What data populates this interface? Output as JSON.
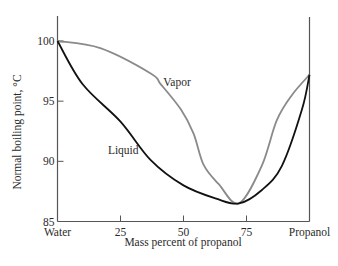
{
  "chart_data": {
    "type": "line",
    "title": "",
    "xlabel": "Mass percent of propanol",
    "ylabel": "Normal boiling point, °C",
    "xlim": [
      0,
      100
    ],
    "ylim": [
      85,
      100
    ],
    "x_ticks": [
      0,
      25,
      50,
      75,
      100
    ],
    "x_tick_labels": [
      "Water",
      "25",
      "50",
      "75",
      "Propanol"
    ],
    "y_ticks": [
      85,
      90,
      95,
      100
    ],
    "y_tick_labels": [
      "85",
      "90",
      "95",
      "100"
    ],
    "grid": false,
    "legend": "inline labels",
    "series": [
      {
        "name": "Vapor",
        "color": "#8a8a8a",
        "x": [
          0,
          17,
          37,
          41,
          49,
          54,
          58,
          64,
          72,
          81,
          87,
          93,
          100
        ],
        "y": [
          100,
          99.4,
          97.3,
          96.4,
          94.3,
          92.3,
          89.7,
          88.1,
          86.5,
          89.6,
          93.4,
          95.5,
          97.2
        ]
      },
      {
        "name": "Liquid",
        "color": "#111111",
        "x": [
          0,
          10,
          25,
          37,
          50,
          63,
          72,
          81,
          89,
          97,
          100
        ],
        "y": [
          100,
          96.4,
          93.3,
          90.1,
          88.0,
          86.9,
          86.5,
          87.6,
          89.6,
          94.3,
          97.2
        ]
      }
    ],
    "annotations": [
      {
        "text": "Vapor",
        "x": 42,
        "y": 96.3
      },
      {
        "text": "Liquid",
        "x": 20,
        "y": 90.6
      }
    ],
    "azeotrope": {
      "mass_percent_propanol": 72,
      "boiling_point_c": 86.5
    }
  }
}
